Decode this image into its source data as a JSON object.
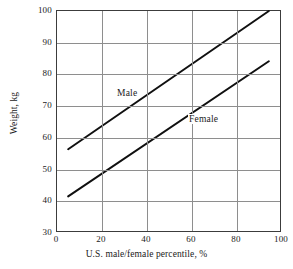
{
  "chart_data": {
    "type": "line",
    "title": "",
    "xlabel": "U.S. male/female percentile, %",
    "ylabel": "Weight, kg",
    "xlim": [
      0,
      100
    ],
    "ylim": [
      30,
      100
    ],
    "xticks": [
      0,
      20,
      40,
      60,
      80,
      100
    ],
    "xtick_labels": [
      "0",
      "20",
      "40",
      "60",
      "80",
      "100"
    ],
    "yticks": [
      100,
      90,
      80,
      70,
      60,
      50,
      40,
      30
    ],
    "ytick_labels": [
      "100",
      "90",
      "80",
      "70",
      "60",
      "50",
      "40",
      "30"
    ],
    "grid": true,
    "legend": "inline-annotation",
    "series": [
      {
        "name": "Male",
        "color": "#101010",
        "points": [
          {
            "x": 5,
            "y": 56
          },
          {
            "x": 95,
            "y": 100
          }
        ],
        "annotation": "Male"
      },
      {
        "name": "Female",
        "color": "#101010",
        "points": [
          {
            "x": 5,
            "y": 41
          },
          {
            "x": 95,
            "y": 84
          }
        ],
        "annotation": "Female"
      }
    ]
  }
}
